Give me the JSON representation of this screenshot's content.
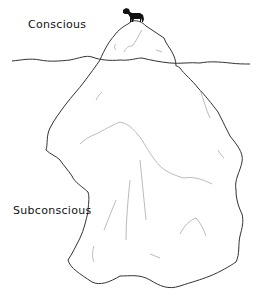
{
  "diagram": {
    "type": "iceberg-metaphor",
    "labels": {
      "conscious": "Conscious",
      "subconscious": "Subconscious"
    },
    "elements": [
      "waterline",
      "iceberg-tip",
      "iceberg-submerged",
      "horse-silhouette"
    ],
    "colors": {
      "stroke": "#333333",
      "shading": "#aaaaaa",
      "horse": "#111111",
      "background": "#ffffff"
    }
  }
}
